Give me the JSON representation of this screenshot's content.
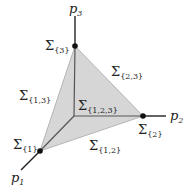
{
  "diagram": {
    "fill_color": "#d6d6d6",
    "stroke_color": "#333333",
    "axes": [
      {
        "name": "p",
        "index": "1",
        "label": "p1"
      },
      {
        "name": "p",
        "index": "2",
        "label": "p2"
      },
      {
        "name": "p",
        "index": "3",
        "label": "p3"
      }
    ],
    "labels": {
      "s1": {
        "symbol": "Σ",
        "sub": "{1}"
      },
      "s2": {
        "symbol": "Σ",
        "sub": "{2}"
      },
      "s3": {
        "symbol": "Σ",
        "sub": "{3}"
      },
      "s12": {
        "symbol": "Σ",
        "sub": "{1,2}"
      },
      "s13": {
        "symbol": "Σ",
        "sub": "{1,3}"
      },
      "s23": {
        "symbol": "Σ",
        "sub": "{2,3}"
      },
      "s123": {
        "symbol": "Σ",
        "sub": "{1,2,3}"
      }
    }
  }
}
